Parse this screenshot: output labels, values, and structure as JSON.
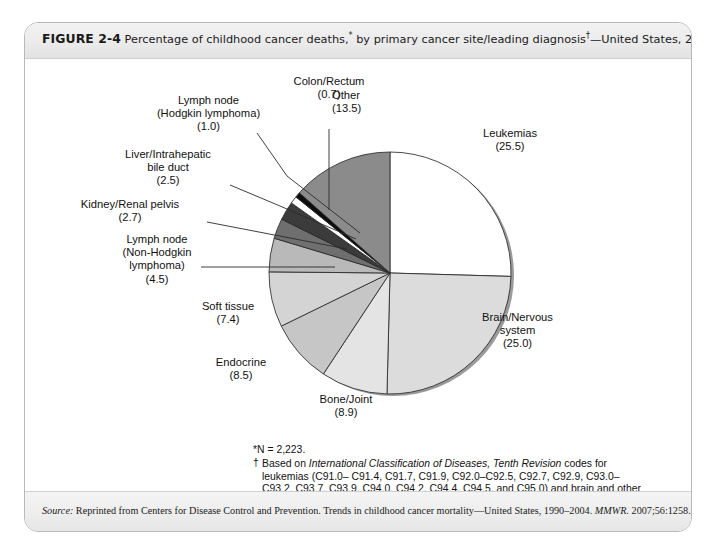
{
  "figure": {
    "number": "FIGURE 2-4",
    "caption_part1": "Percentage of childhood cancer deaths,",
    "caption_star": "*",
    "caption_part2": " by primary cancer site/leading diagnosis",
    "caption_dagger": "†",
    "caption_part3": "—United States, 2004."
  },
  "notes": {
    "note1": "*N = 2,223.",
    "note2_dagger": "†",
    "note2_lead": "Based on ",
    "note2_italic": "International Classification of Diseases, Tenth Revision",
    "note2_rest": " codes for leukemias (C91.0– C91.4, C91.7, C91.9, C92.0–C92.5, C92.7, C92.9, C93.0– C93.2, C93.7, C93.9, C94.0, C94.2, C94.4, C94.5, and C95.0) and brain and other nervous system neoplasms (C70–C72)."
  },
  "source": {
    "label": "Source:",
    "text": " Reprinted from Centers for Disease Control and Prevention. Trends in childhood cancer mortality—United States, 1990–2004. ",
    "journal": "MMWR.",
    "citation": " 2007;56:1258."
  },
  "chart_data": {
    "type": "pie",
    "total_n": 2223,
    "units": "percent",
    "start_angle_deg": 0,
    "direction": "clockwise",
    "center": {
      "x": 389,
      "y": 250
    },
    "radius": 121,
    "categories": [
      "Leukemias",
      "Brain/Nervous system",
      "Bone/Joint",
      "Endocrine",
      "Soft tissue",
      "Lymph node (Non-Hodgkin lymphoma)",
      "Kidney/Renal pelvis",
      "Liver/Intrahepatic bile duct",
      "Lymph node (Hodgkin lymphoma)",
      "Colon/Rectum",
      "Other"
    ],
    "values": [
      25.5,
      25.0,
      8.9,
      8.5,
      7.4,
      4.5,
      2.7,
      2.5,
      1.0,
      0.7,
      13.5
    ],
    "colors": [
      "#ffffff",
      "#dcdcdc",
      "#e4e4e4",
      "#c6c6c6",
      "#d4d4d4",
      "#b9b9b9",
      "#6f6f6f",
      "#3b3b3b",
      "#ffffff",
      "#0d0d0d",
      "#8b8b8b"
    ],
    "slice_labels": [
      {
        "name": "Leukemias",
        "line1": "Leukemias",
        "line2": "",
        "line3": "",
        "value": "(25.5)"
      },
      {
        "name": "Brain/Nervous system",
        "line1": "Brain/Nervous",
        "line2": "system",
        "line3": "",
        "value": "(25.0)"
      },
      {
        "name": "Bone/Joint",
        "line1": "Bone/Joint",
        "line2": "",
        "line3": "",
        "value": "(8.9)"
      },
      {
        "name": "Endocrine",
        "line1": "Endocrine",
        "line2": "",
        "line3": "",
        "value": "(8.5)"
      },
      {
        "name": "Soft tissue",
        "line1": "Soft tissue",
        "line2": "",
        "line3": "",
        "value": "(7.4)"
      },
      {
        "name": "Non-Hodgkin",
        "line1": "Lymph node",
        "line2": "(Non-Hodgkin",
        "line3": "lymphoma)",
        "value": "(4.5)"
      },
      {
        "name": "Kidney/Renal pelvis",
        "line1": "Kidney/Renal pelvis",
        "line2": "",
        "line3": "",
        "value": "(2.7)"
      },
      {
        "name": "Liver/Intrahepatic",
        "line1": "Liver/Intrahepatic",
        "line2": "bile duct",
        "line3": "",
        "value": "(2.5)"
      },
      {
        "name": "Hodgkin",
        "line1": "Lymph node",
        "line2": "(Hodgkin lymphoma)",
        "line3": "",
        "value": "(1.0)"
      },
      {
        "name": "Colon/Rectum",
        "line1": "Colon/Rectum",
        "line2": "",
        "line3": "",
        "value": "(0.7)"
      },
      {
        "name": "Other",
        "line1": "Other",
        "line2": "",
        "line3": "",
        "value": "(13.5)"
      }
    ],
    "legend": "none",
    "grid": false
  }
}
